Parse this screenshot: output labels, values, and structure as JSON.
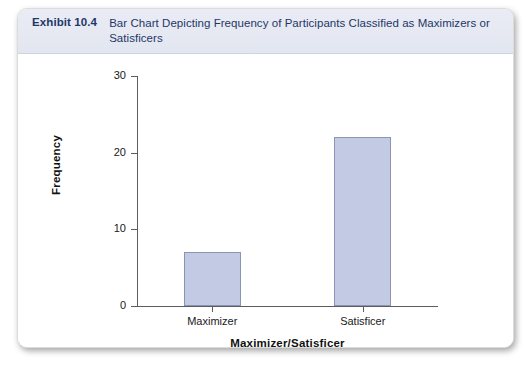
{
  "exhibit": {
    "number": "Exhibit 10.4",
    "caption": "Bar Chart Depicting Frequency of Participants Classified as Maximizers or Satisficers"
  },
  "colors": {
    "header_band": "#e6e9f2",
    "header_text": "#1f3668",
    "bar_fill": "#c3cbe4",
    "bar_border": "#8b94b7",
    "axis_line": "#5c5c5c"
  },
  "chart_data": {
    "type": "bar",
    "title": "",
    "categories": [
      "Maximizer",
      "Satisficer"
    ],
    "values": [
      7,
      22
    ],
    "xlabel": "Maximizer/Satisficer",
    "ylabel": "Frequency",
    "ylim": [
      0,
      30
    ],
    "yticks": [
      0,
      10,
      20,
      30
    ],
    "ytick_labels": [
      "0",
      "10",
      "20",
      "30"
    ],
    "grid": false,
    "legend": false
  }
}
